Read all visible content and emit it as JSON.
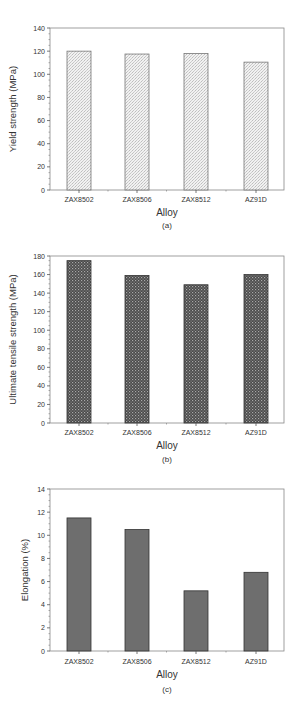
{
  "chart_data": [
    {
      "type": "bar",
      "panel": "(a)",
      "categories": [
        "ZAX8502",
        "ZAX8506",
        "ZAX8512",
        "AZ91D"
      ],
      "values": [
        120,
        117.5,
        118,
        110.5
      ],
      "title": "",
      "xlabel": "Alloy",
      "ylabel": "Yield strength (MPa)",
      "ylim": [
        0,
        140
      ],
      "yticks": [
        0,
        20,
        40,
        60,
        80,
        100,
        120,
        140
      ],
      "grid": false,
      "bar_pattern": "light-stipple",
      "caption": "(a)"
    },
    {
      "type": "bar",
      "panel": "(b)",
      "categories": [
        "ZAX8502",
        "ZAX8506",
        "ZAX8512",
        "AZ91D"
      ],
      "values": [
        175,
        159,
        149,
        160
      ],
      "title": "",
      "xlabel": "Alloy",
      "ylabel": "Ultimate tensile strength (MPa)",
      "ylim": [
        0,
        180
      ],
      "yticks": [
        0,
        20,
        40,
        60,
        80,
        100,
        120,
        140,
        160,
        180
      ],
      "grid": false,
      "bar_pattern": "dark-crosshatch",
      "caption": "(b)"
    },
    {
      "type": "bar",
      "panel": "(c)",
      "categories": [
        "ZAX8502",
        "ZAX8506",
        "ZAX8512",
        "AZ91D"
      ],
      "values": [
        11.5,
        10.5,
        5.2,
        6.8
      ],
      "title": "",
      "xlabel": "Alloy",
      "ylabel": "Elongation (%)",
      "ylim": [
        0,
        14
      ],
      "yticks": [
        0,
        2,
        4,
        6,
        8,
        10,
        12,
        14
      ],
      "grid": false,
      "bar_pattern": "solid-gray",
      "caption": "(c)"
    }
  ]
}
